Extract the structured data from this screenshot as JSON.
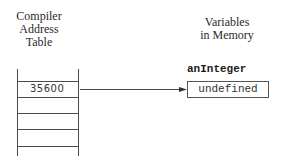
{
  "left_heading": {
    "line1": "Compiler",
    "line2": "Address",
    "line3": "Table"
  },
  "right_heading": {
    "line1": "Variables",
    "line2": "in Memory"
  },
  "table": {
    "rows": [
      {
        "value": "35600"
      },
      {
        "value": ""
      },
      {
        "value": ""
      },
      {
        "value": ""
      }
    ]
  },
  "variable": {
    "name": "anInteger",
    "value": "undefined"
  },
  "colors": {
    "line": "#4a4a4a",
    "text": "#2a2a2a",
    "background": "#ffffff"
  }
}
